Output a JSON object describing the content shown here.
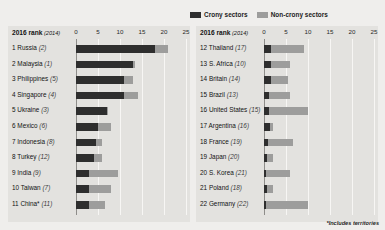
{
  "legend": {
    "crony_label": "Crony sectors",
    "noncrony_label": "Non-crony sectors",
    "crony_color": "#2e2e2e",
    "noncrony_color": "#9d9d9c"
  },
  "header": {
    "rank_title": "2016 rank",
    "rank_year": "(2014)"
  },
  "footnote": "*Includes territories",
  "chart_data": {
    "type": "bar",
    "orientation": "horizontal",
    "stacked": true,
    "title": "",
    "xlabel": "",
    "ylabel": "",
    "xlim": [
      0,
      25
    ],
    "xticks": [
      0,
      5,
      10,
      15,
      20,
      25
    ],
    "grid": true,
    "legend_position": "top-right",
    "series": [
      {
        "name": "Crony sectors",
        "color": "#2e2e2e"
      },
      {
        "name": "Non-crony sectors",
        "color": "#9d9d9c"
      }
    ],
    "panels": [
      {
        "panel": "left",
        "xticks": [
          0,
          5,
          10,
          15,
          20,
          25
        ],
        "rows": [
          {
            "rank": "1",
            "name": "Russia",
            "prev": "(2)",
            "crony": 18.0,
            "noncrony": 3.0
          },
          {
            "rank": "2",
            "name": "Malaysia",
            "prev": "(1)",
            "crony": 13.0,
            "noncrony": 0.3
          },
          {
            "rank": "3",
            "name": "Philippines",
            "prev": "(5)",
            "crony": 11.0,
            "noncrony": 2.0
          },
          {
            "rank": "4",
            "name": "Singapore",
            "prev": "(4)",
            "crony": 10.8,
            "noncrony": 3.2
          },
          {
            "rank": "5",
            "name": "Ukraine",
            "prev": "(3)",
            "crony": 7.0,
            "noncrony": 0.2
          },
          {
            "rank": "6",
            "name": "Mexico",
            "prev": "(6)",
            "crony": 5.0,
            "noncrony": 3.0
          },
          {
            "rank": "7",
            "name": "Indonesia",
            "prev": "(8)",
            "crony": 4.5,
            "noncrony": 1.5
          },
          {
            "rank": "8",
            "name": "Turkey",
            "prev": "(12)",
            "crony": 4.0,
            "noncrony": 2.0
          },
          {
            "rank": "9",
            "name": "India",
            "prev": "(9)",
            "crony": 3.0,
            "noncrony": 6.5
          },
          {
            "rank": "10",
            "name": "Taiwan",
            "prev": "(7)",
            "crony": 3.0,
            "noncrony": 5.0
          },
          {
            "rank": "11",
            "name": "China*",
            "prev": "(11)",
            "crony": 3.0,
            "noncrony": 3.5
          }
        ]
      },
      {
        "panel": "right",
        "xticks": [
          0,
          5,
          10,
          15,
          20,
          25
        ],
        "rows": [
          {
            "rank": "12",
            "name": "Thailand",
            "prev": "(17)",
            "crony": 1.6,
            "noncrony": 7.4
          },
          {
            "rank": "13",
            "name": "S. Africa",
            "prev": "(10)",
            "crony": 1.5,
            "noncrony": 4.5
          },
          {
            "rank": "14",
            "name": "Britain",
            "prev": "(14)",
            "crony": 1.5,
            "noncrony": 4.0
          },
          {
            "rank": "15",
            "name": "Brazil",
            "prev": "(13)",
            "crony": 1.2,
            "noncrony": 4.8
          },
          {
            "rank": "16",
            "name": "United States",
            "prev": "(15)",
            "crony": 1.1,
            "noncrony": 8.9
          },
          {
            "rank": "17",
            "name": "Argentina",
            "prev": "(16)",
            "crony": 1.4,
            "noncrony": 0.6
          },
          {
            "rank": "18",
            "name": "France",
            "prev": "(19)",
            "crony": 0.9,
            "noncrony": 5.6
          },
          {
            "rank": "19",
            "name": "Japan",
            "prev": "(20)",
            "crony": 0.7,
            "noncrony": 1.3
          },
          {
            "rank": "20",
            "name": "S. Korea",
            "prev": "(21)",
            "crony": 0.5,
            "noncrony": 5.5
          },
          {
            "rank": "21",
            "name": "Poland",
            "prev": "(18)",
            "crony": 0.6,
            "noncrony": 1.4
          },
          {
            "rank": "22",
            "name": "Germany",
            "prev": "(22)",
            "crony": 0.4,
            "noncrony": 9.6
          }
        ]
      }
    ]
  }
}
